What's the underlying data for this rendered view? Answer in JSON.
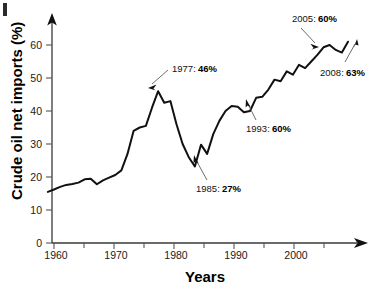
{
  "chart_data": {
    "type": "line",
    "title": "",
    "xlabel": "Years",
    "ylabel": "Crude oil net imports (%)",
    "xlim": [
      1958,
      2009
    ],
    "ylim": [
      0,
      66
    ],
    "grid": false,
    "legend": "none",
    "xticks_major": [
      1960,
      1970,
      1980,
      1990,
      2000
    ],
    "xticks_minor": [
      1965,
      1975,
      1985,
      1995,
      2005
    ],
    "yticks": [
      0,
      10,
      20,
      30,
      40,
      50,
      60
    ],
    "series": [
      {
        "name": "Crude oil net imports",
        "x": [
          1959,
          1960,
          1961,
          1962,
          1963,
          1964,
          1965,
          1966,
          1967,
          1968,
          1969,
          1970,
          1971,
          1972,
          1973,
          1974,
          1975,
          1976,
          1977,
          1978,
          1979,
          1980,
          1981,
          1982,
          1983,
          1984,
          1985,
          1986,
          1987,
          1988,
          1989,
          1990,
          1991,
          1992,
          1993,
          1994,
          1995,
          1996,
          1997,
          1998,
          1999,
          2000,
          2001,
          2002,
          2003,
          2004,
          2005,
          2006,
          2007,
          2008
        ],
        "values": [
          15.5,
          16.2,
          17.0,
          17.6,
          17.9,
          18.3,
          19.3,
          19.5,
          17.8,
          19.0,
          19.8,
          20.6,
          22.0,
          27.0,
          34.0,
          35.0,
          35.5,
          41.0,
          46.0,
          42.5,
          43.0,
          36.0,
          30.0,
          26.0,
          23.2,
          29.8,
          27.0,
          33.0,
          37.0,
          40.0,
          41.5,
          41.3,
          39.6,
          40.0,
          44.0,
          44.3,
          46.5,
          49.5,
          49.0,
          52.0,
          51.0,
          54.0,
          53.0,
          55.0,
          57.0,
          59.3,
          60.0,
          58.5,
          57.7,
          61.0
        ]
      }
    ],
    "annotations": [
      {
        "id": "anno-1977",
        "year_label": "1977:",
        "value_label": "46%",
        "x": 1977,
        "y": 46
      },
      {
        "id": "anno-1985",
        "year_label": "1985:",
        "value_label": "27%",
        "x": 1985,
        "y": 27
      },
      {
        "id": "anno-1993",
        "year_label": "1993:",
        "value_label": "44%",
        "x": 1993,
        "y": 44
      },
      {
        "id": "anno-2005",
        "year_label": "2005:",
        "value_label": "60%",
        "x": 2005,
        "y": 60
      },
      {
        "id": "anno-2008",
        "year_label": "2008:",
        "value_label": "63%",
        "x": 2008,
        "y": 63
      }
    ]
  },
  "axes": {
    "y_label_text": "Crude oil net imports (%)",
    "x_label_text": "Years",
    "ytick_labels": [
      "0",
      "10",
      "20",
      "30",
      "40",
      "50",
      "60"
    ],
    "xtick_labels": [
      "1960",
      "1970",
      "1980",
      "1990",
      "2000"
    ]
  }
}
